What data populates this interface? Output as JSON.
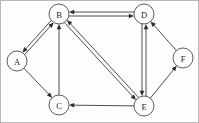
{
  "figure": {
    "type": "directed-graph",
    "width": 199,
    "height": 123,
    "background_color": "#fefefe",
    "border_color": "#b8b8b8"
  },
  "style": {
    "node_fill": "#ffffff",
    "node_stroke": "#4a4a4a",
    "edge_color": "#3a3a3a",
    "arrow_color": "#2b2b2b",
    "label_color": "#1c1c1c",
    "node_radius": 10
  },
  "graph_data": {
    "type": "directed-graph",
    "node_count": 6,
    "edge_count": 9,
    "nodes": [
      {
        "id": "A",
        "label": "A",
        "x": 16,
        "y": 60
      },
      {
        "id": "B",
        "label": "B",
        "x": 58,
        "y": 13
      },
      {
        "id": "C",
        "label": "C",
        "x": 58,
        "y": 104
      },
      {
        "id": "D",
        "label": "D",
        "x": 143,
        "y": 13
      },
      {
        "id": "E",
        "label": "E",
        "x": 143,
        "y": 105
      },
      {
        "id": "F",
        "label": "F",
        "x": 182,
        "y": 57
      }
    ],
    "edges": [
      {
        "id": "A-B",
        "from": "A",
        "to": "B",
        "directed": "both",
        "style": "double-line",
        "offset": 1.6
      },
      {
        "id": "A-C",
        "from": "A",
        "to": "C",
        "directed": "forward",
        "style": "single-line",
        "offset": 0
      },
      {
        "id": "C-B",
        "from": "C",
        "to": "B",
        "directed": "forward",
        "style": "single-line",
        "offset": 0
      },
      {
        "id": "B-D",
        "from": "B",
        "to": "D",
        "directed": "both",
        "style": "double-line",
        "offset": 2.0
      },
      {
        "id": "B-E",
        "from": "B",
        "to": "E",
        "directed": "both",
        "style": "double-line",
        "offset": 1.8
      },
      {
        "id": "D-E",
        "from": "D",
        "to": "E",
        "directed": "both",
        "style": "double-line",
        "offset": 2.0
      },
      {
        "id": "E-F",
        "from": "E",
        "to": "F",
        "directed": "forward",
        "style": "single-line",
        "offset": 0
      },
      {
        "id": "F-D",
        "from": "F",
        "to": "D",
        "directed": "forward",
        "style": "single-line",
        "offset": 0
      },
      {
        "id": "E-C",
        "from": "E",
        "to": "C",
        "directed": "forward",
        "style": "single-line",
        "offset": 0
      }
    ]
  }
}
